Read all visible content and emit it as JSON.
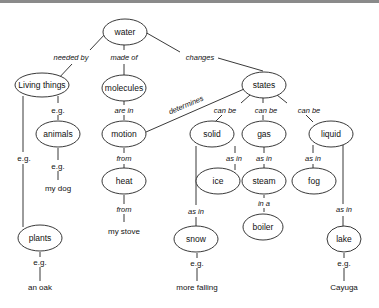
{
  "diagram": {
    "type": "concept-map",
    "nodes": {
      "water": "water",
      "living_things": "Living things",
      "molecules": "molecules",
      "states": "states",
      "animals": "animals",
      "motion": "motion",
      "solid": "solid",
      "gas": "gas",
      "liquid": "liquid",
      "heat": "heat",
      "ice": "ice",
      "steam": "steam",
      "fog": "fog",
      "boiler": "boiler",
      "plants": "plants",
      "snow": "snow",
      "lake": "lake"
    },
    "leaves": {
      "my_dog": "my dog",
      "my_stove": "my stove",
      "an_oak": "an oak",
      "more_falling": "more falling",
      "cayuga": "Cayuga"
    },
    "links": {
      "needed_by": "needed by",
      "made_of": "made of",
      "changes": "changes",
      "determines": "determines",
      "living_eg_animals": "e.g.",
      "living_eg_plants": "e.g.",
      "animals_eg": "e.g.",
      "are_in": "are in",
      "motion_from": "from",
      "heat_from": "from",
      "can_be_solid": "can be",
      "can_be_gas": "can be",
      "can_be_liquid": "can be",
      "solid_as_in_ice": "as in",
      "solid_as_in_snow": "as in",
      "gas_as_in": "as in",
      "liquid_as_in_fog": "as in",
      "liquid_as_in_lake": "as in",
      "in_a": "in a",
      "plants_eg": "e.g.",
      "snow_eg": "e.g.",
      "lake_eg": "e.g."
    }
  }
}
